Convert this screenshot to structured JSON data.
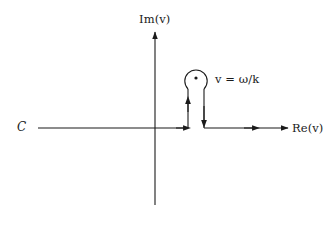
{
  "figure": {
    "type": "complex-plane-contour-diagram",
    "background_color": "#ffffff",
    "stroke_color": "#1a1a1a",
    "labels": {
      "imaginary_axis": "Im(v)",
      "real_axis": "Re(v)",
      "contour": "C",
      "pole_annotation": "v = ω/k",
      "pole_annotation_parts": {
        "variable": "v",
        "operator": "=",
        "value": "ω/k"
      }
    },
    "geometry": {
      "origin": {
        "x": 155,
        "y": 128
      },
      "imaginary_axis": {
        "x": 155,
        "y_top": 31,
        "y_bottom": 205,
        "arrow": "up"
      },
      "real_axis": {
        "y": 128,
        "x_left": 38,
        "x_right": 289,
        "arrow": "right"
      },
      "pole_marker": {
        "x": 196,
        "y": 78,
        "radius": 1.6
      },
      "indentation_circle": {
        "center_x": 196,
        "center_y": 78,
        "radius": 11.2
      },
      "contour_left_riser": {
        "x": 188,
        "y_bottom": 128,
        "y_top": 89,
        "arrow": "up"
      },
      "contour_right_riser": {
        "x": 204,
        "y_top": 89,
        "y_bottom": 128,
        "arrow": "down"
      },
      "direction_arrows_on_real_axis": [
        {
          "x": 186,
          "y": 128,
          "direction": "right"
        },
        {
          "x": 256,
          "y": 128,
          "direction": "right"
        },
        {
          "x": 289,
          "y": 128,
          "direction": "right"
        }
      ]
    }
  }
}
